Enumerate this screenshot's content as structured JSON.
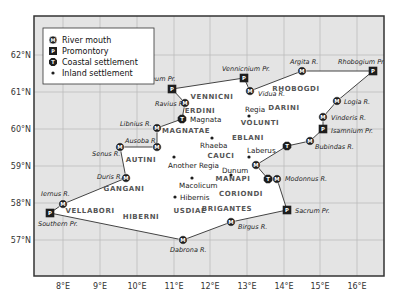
{
  "map": {
    "frame": {
      "x": 34,
      "y": 16,
      "w": 350,
      "h": 260
    },
    "colors": {
      "sea": "#e4e4e4",
      "land": "#ffffff",
      "grid": "#b8b8b8",
      "frame": "#333333",
      "coastline": "#444444",
      "marker": "#1e1e1e"
    },
    "longitude_ticks": [
      {
        "label": "8°E",
        "x": 63
      },
      {
        "label": "9°E",
        "x": 100
      },
      {
        "label": "10°E",
        "x": 137
      },
      {
        "label": "11°E",
        "x": 174
      },
      {
        "label": "12°E",
        "x": 210
      },
      {
        "label": "13°E",
        "x": 247
      },
      {
        "label": "14°E",
        "x": 284
      },
      {
        "label": "15°E",
        "x": 320
      },
      {
        "label": "16°E",
        "x": 357
      }
    ],
    "latitude_ticks": [
      {
        "label": "62°N",
        "y": 55
      },
      {
        "label": "61°N",
        "y": 92
      },
      {
        "label": "60°N",
        "y": 129
      },
      {
        "label": "59°N",
        "y": 166
      },
      {
        "label": "58°N",
        "y": 203
      },
      {
        "label": "57°N",
        "y": 240
      }
    ]
  },
  "legend": {
    "items": [
      {
        "symbol": "M",
        "shape": "circle",
        "label": "River mouth"
      },
      {
        "symbol": "P",
        "shape": "square",
        "label": "Promontory"
      },
      {
        "symbol": "T",
        "shape": "octagon",
        "label": "Coastal settlement"
      },
      {
        "symbol": "dot",
        "shape": "dot",
        "label": "Inland settlement"
      }
    ]
  },
  "coast_points": [
    {
      "name": "Boreum Pr.",
      "type": "P",
      "x": 172,
      "y": 89,
      "lx": 140,
      "ly": 81
    },
    {
      "name": "Vennicnium Pr.",
      "type": "P",
      "x": 244,
      "y": 78,
      "lx": 222,
      "ly": 71
    },
    {
      "name": "Vidua R.",
      "type": "M",
      "x": 250,
      "y": 91,
      "lx": 258,
      "ly": 96
    },
    {
      "name": "Argita R.",
      "type": "M",
      "x": 302,
      "y": 71,
      "lx": 290,
      "ly": 64
    },
    {
      "name": "Rhobogium Pr.",
      "type": "P",
      "x": 373,
      "y": 71,
      "lx": 338,
      "ly": 64
    },
    {
      "name": "Logia R.",
      "type": "M",
      "x": 337,
      "y": 101,
      "lx": 344,
      "ly": 104
    },
    {
      "name": "Vinderis R.",
      "type": "M",
      "x": 323,
      "y": 117,
      "lx": 331,
      "ly": 120
    },
    {
      "name": "Isamnium Pr.",
      "type": "P",
      "x": 323,
      "y": 129,
      "lx": 331,
      "ly": 133
    },
    {
      "name": "Bubindas R.",
      "type": "M",
      "x": 310,
      "y": 141,
      "lx": 315,
      "ly": 149
    },
    {
      "name": "Ravius R.",
      "type": "M",
      "x": 185,
      "y": 103,
      "lx": 155,
      "ly": 106
    },
    {
      "name": "Magnata",
      "type": "T",
      "x": 182,
      "y": 119,
      "lx": 190,
      "ly": 122,
      "upright": true
    },
    {
      "name": "Libnius R.",
      "type": "M",
      "x": 157,
      "y": 128,
      "lx": 120,
      "ly": 126
    },
    {
      "name": "Ausoba R.",
      "type": "M",
      "x": 157,
      "y": 147,
      "lx": 125,
      "ly": 143
    },
    {
      "name": "Senus R.",
      "type": "M",
      "x": 120,
      "y": 147,
      "lx": 92,
      "ly": 156
    },
    {
      "name": "Duris R.",
      "type": "M",
      "x": 126,
      "y": 178,
      "lx": 97,
      "ly": 179
    },
    {
      "name": "Iernus R.",
      "type": "M",
      "x": 63,
      "y": 204,
      "lx": 41,
      "ly": 196
    },
    {
      "name": "Southern Pr.",
      "type": "P",
      "x": 50,
      "y": 213,
      "lx": 38,
      "ly": 226
    },
    {
      "name": "Dabrona R.",
      "type": "M",
      "x": 183,
      "y": 240,
      "lx": 170,
      "ly": 252
    },
    {
      "name": "Birgus R.",
      "type": "M",
      "x": 231,
      "y": 222,
      "lx": 238,
      "ly": 229
    },
    {
      "name": "Sacrum Pr.",
      "type": "P",
      "x": 287,
      "y": 210,
      "lx": 295,
      "ly": 213
    },
    {
      "name": "Modonnus R.",
      "type": "M",
      "x": 277,
      "y": 179,
      "lx": 285,
      "ly": 181
    },
    {
      "name": "Manapi T",
      "type": "T",
      "x": 268,
      "y": 179,
      "nolabel": true
    },
    {
      "name": "Manapi M",
      "type": "M",
      "x": 256,
      "y": 165,
      "nolabel": true
    },
    {
      "name": "Laberus T",
      "type": "T",
      "x": 287,
      "y": 146,
      "nolabel": true
    }
  ],
  "coastline_order": [
    "Southern Pr.",
    "Iernus R.",
    "Duris R.",
    "Senus R.",
    "Ausoba R.",
    "Libnius R.",
    "Magnata",
    "Ravius R.",
    "Boreum Pr.",
    "Vennicnium Pr.",
    "Vidua R.",
    "Argita R.",
    "Rhobogium Pr.",
    "Logia R.",
    "Vinderis R.",
    "Isamnium Pr.",
    "Bubindas R.",
    "Laberus T",
    "Manapi M",
    "Manapi T",
    "Modonnus R.",
    "Sacrum Pr.",
    "Birgus R.",
    "Dabrona R.",
    "Southern Pr."
  ],
  "tribes": [
    {
      "name": "VENNICNI",
      "x": 212,
      "y": 99
    },
    {
      "name": "RHOBOGDI",
      "x": 296,
      "y": 91
    },
    {
      "name": "ERDINI",
      "x": 200,
      "y": 113
    },
    {
      "name": "DARINI",
      "x": 284,
      "y": 110
    },
    {
      "name": "MAGNATAE",
      "x": 186,
      "y": 133
    },
    {
      "name": "VOLUNTI",
      "x": 260,
      "y": 125
    },
    {
      "name": "EBLANI",
      "x": 248,
      "y": 140
    },
    {
      "name": "AUTINI",
      "x": 141,
      "y": 162
    },
    {
      "name": "CAUCI",
      "x": 221,
      "y": 158
    },
    {
      "name": "GANGANI",
      "x": 124,
      "y": 191
    },
    {
      "name": "MANAPI",
      "x": 233,
      "y": 181
    },
    {
      "name": "CORIONDI",
      "x": 241,
      "y": 196
    },
    {
      "name": "VELLABORI",
      "x": 90,
      "y": 213
    },
    {
      "name": "USDIAE",
      "x": 190,
      "y": 213
    },
    {
      "name": "BRIGANTES",
      "x": 227,
      "y": 211
    },
    {
      "name": "HIBERNI",
      "x": 141,
      "y": 219
    }
  ],
  "towns": [
    {
      "name": "Regia",
      "x": 249,
      "y": 116,
      "lx": 245,
      "ly": 112
    },
    {
      "name": "Rhaeba",
      "x": 212,
      "y": 138,
      "lx": 200,
      "ly": 148
    },
    {
      "name": "Laberus",
      "x": 249,
      "y": 157,
      "lx": 247,
      "ly": 153
    },
    {
      "name": "Another Regia",
      "x": 174,
      "y": 157,
      "lx": 168,
      "ly": 168
    },
    {
      "name": "Dunum",
      "x": 231,
      "y": 175,
      "lx": 222,
      "ly": 173
    },
    {
      "name": "Macolicum",
      "x": 192,
      "y": 178,
      "lx": 179,
      "ly": 188
    },
    {
      "name": "Hibernis",
      "x": 175,
      "y": 197,
      "lx": 180,
      "ly": 200
    }
  ]
}
